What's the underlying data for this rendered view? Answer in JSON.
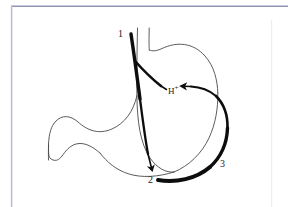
{
  "figure": {
    "name": "stomach-acid-secretion-diagram",
    "background_color": "#ffffff",
    "frame": {
      "color": "#9aa0bb",
      "left_px": 11,
      "top_px": 6,
      "right_px": 272,
      "bottom_px": 207
    },
    "anatomy": {
      "outline_color": "#4a4a4a",
      "outline_width_px": 0.9,
      "parts": [
        "esophagus",
        "fundus",
        "body",
        "antrum",
        "pylorus",
        "duodenum"
      ]
    },
    "arrows": {
      "color": "#0d0d0d",
      "items": [
        {
          "id": "arrow-1",
          "label": "1",
          "description": "vagal pathway descending along lesser curvature, bifurcating",
          "head_target": "2"
        },
        {
          "id": "arrow-1-branch",
          "label": "",
          "description": "branch of pathway 1 directed toward H+ in gastric body",
          "head_target": "H+"
        },
        {
          "id": "arrow-3",
          "label": "3",
          "description": "pathway sweeping up the greater curvature toward H+",
          "head_target": "H+"
        }
      ]
    },
    "labels": [
      {
        "id": "label-1",
        "text": "1",
        "x": 118,
        "y": 29
      },
      {
        "id": "label-2",
        "text": "2",
        "x": 148,
        "y": 175
      },
      {
        "id": "label-3",
        "text": "3",
        "x": 220,
        "y": 159
      },
      {
        "id": "label-h-plus",
        "text": "H",
        "sup": "+",
        "x": 168,
        "y": 85
      }
    ]
  }
}
